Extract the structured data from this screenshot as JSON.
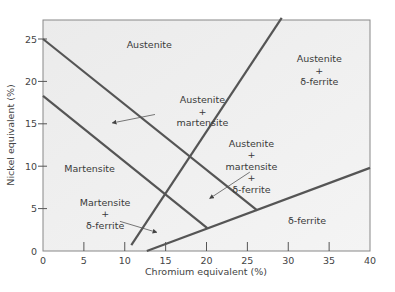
{
  "chart_data": {
    "type": "line",
    "title": "",
    "xlabel": "Chromium equivalent (%)",
    "ylabel": "Nickel equivalent (%)",
    "xlim": [
      0,
      40
    ],
    "ylim": [
      0,
      27.5
    ],
    "xticks": [
      0,
      5,
      10,
      15,
      20,
      25,
      30,
      35,
      40
    ],
    "yticks": [
      0,
      5,
      10,
      15,
      20,
      25
    ],
    "grid": false,
    "legend": "none",
    "series": [
      {
        "name": "austenite-upper-boundary",
        "x": [
          0,
          26.2
        ],
        "y": [
          25,
          4.8
        ]
      },
      {
        "name": "martensite-boundary",
        "x": [
          0,
          20.1
        ],
        "y": [
          18.3,
          2.7
        ]
      },
      {
        "name": "ferrite-steep-boundary",
        "x": [
          10.8,
          29.2
        ],
        "y": [
          0.7,
          27.5
        ]
      },
      {
        "name": "delta-ferrite-boundary",
        "x": [
          12.7,
          40
        ],
        "y": [
          0,
          9.8
        ]
      }
    ],
    "regions": [
      {
        "label": [
          "Austenite"
        ],
        "x": 13,
        "y": 24.3
      },
      {
        "label": [
          "Austenite",
          "+",
          "δ-ferrite"
        ],
        "x": 33.8,
        "y": 21.3
      },
      {
        "label": [
          "Austenite",
          "+",
          "martensite"
        ],
        "x": 19.5,
        "y": 16.5
      },
      {
        "label": [
          "Austenite",
          "+",
          "martensite",
          "+",
          "δ-ferrite"
        ],
        "x": 25.5,
        "y": 10
      },
      {
        "label": [
          "Martensite"
        ],
        "x": 5.7,
        "y": 9.7
      },
      {
        "label": [
          "Martensite",
          "+",
          "δ-ferrite"
        ],
        "x": 7.6,
        "y": 4.4
      },
      {
        "label": [
          "δ-ferrite"
        ],
        "x": 32.3,
        "y": 3.6
      }
    ],
    "annotations": [
      {
        "type": "arrow",
        "from": [
          13.7,
          16.1
        ],
        "to": [
          8.5,
          15.1
        ]
      },
      {
        "type": "arrow",
        "from": [
          25.3,
          9.3
        ],
        "to": [
          20.4,
          6.2
        ]
      },
      {
        "type": "arrow",
        "from": [
          9.4,
          3.5
        ],
        "to": [
          13.9,
          2.2
        ]
      }
    ]
  }
}
